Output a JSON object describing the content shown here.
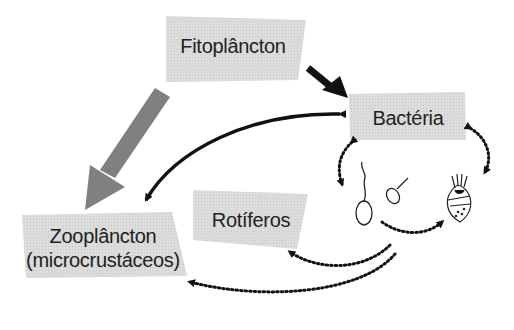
{
  "nodes": {
    "fitoplancton": {
      "label": "Fitoplâncton"
    },
    "bacteria": {
      "label": "Bactéria"
    },
    "zooplancton": {
      "label_line1": "Zooplâncton",
      "label_line2": "(microcrustáceos)"
    },
    "rotiferos": {
      "label": "Rotíferos"
    }
  },
  "organisms": [
    "flagellate-large",
    "flagellate-small",
    "ciliate"
  ],
  "colors": {
    "box_fill": "#d9d9d9",
    "grey_arrow": "#808080",
    "black_arrow": "#111111",
    "text": "#222222"
  },
  "edges": [
    {
      "from": "fitoplancton",
      "to": "zooplancton",
      "style": "thick-grey"
    },
    {
      "from": "fitoplancton",
      "to": "bacteria",
      "style": "thick-black"
    },
    {
      "from": "bacteria",
      "to": "zooplancton",
      "style": "curved-bidirectional-black"
    },
    {
      "from": "bacteria",
      "to": "flagellates",
      "style": "dotted-bidirectional"
    },
    {
      "from": "bacteria",
      "to": "ciliate",
      "style": "dotted-bidirectional"
    },
    {
      "from": "flagellates",
      "to": "ciliate",
      "style": "dotted"
    },
    {
      "from": "protozoa",
      "to": "rotiferos",
      "style": "dotted"
    },
    {
      "from": "protozoa",
      "to": "zooplancton",
      "style": "dotted"
    }
  ]
}
